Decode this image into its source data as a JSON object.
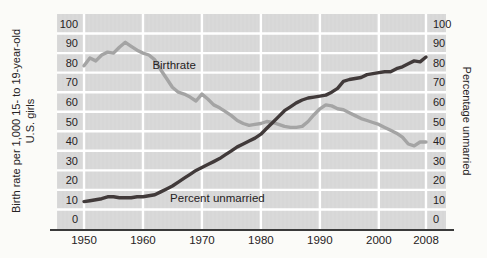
{
  "figure": {
    "left_axis_title_line1": "Birth rate per 1,000 15- to 19-year-old",
    "left_axis_title_line2": "U.S. girls",
    "right_axis_title": "Percentage unmarried"
  },
  "colors": {
    "panel_bg": "#d9d9d9",
    "gridline": "#ffffff",
    "axis_line": "#3a3a3a",
    "text": "#262223",
    "birthrate_line": "#a4a4a4",
    "unmarried_line": "#413a3a"
  },
  "chart_data": {
    "type": "line",
    "title": "",
    "xlabel": "",
    "ylabel_left": "Birth rate per 1,000 15- to 19-year-old U.S. girls",
    "ylabel_right": "Percentage unmarried",
    "xlim": [
      1950,
      2008
    ],
    "ylim": [
      0,
      100
    ],
    "grid": "white lines on gray banded panel",
    "legend_position": "inline annotations",
    "y_ticks_top_to_bottom": [
      100,
      90,
      80,
      70,
      60,
      50,
      40,
      30,
      20,
      10,
      0
    ],
    "x_ticks": [
      {
        "year": 1950,
        "label": "1950"
      },
      {
        "year": 1960,
        "label": "1960"
      },
      {
        "year": 1970,
        "label": "1970"
      },
      {
        "year": 1980,
        "label": "1980"
      },
      {
        "year": 1990,
        "label": "1990"
      },
      {
        "year": 2000,
        "label": "2000"
      },
      {
        "year": 2008,
        "label": "2008"
      }
    ],
    "x_gridline_years": [
      1950,
      1960,
      1970,
      1980,
      1990,
      2000,
      2008
    ],
    "x": [
      1950,
      1951,
      1952,
      1953,
      1954,
      1955,
      1956,
      1957,
      1958,
      1959,
      1960,
      1961,
      1962,
      1963,
      1964,
      1965,
      1966,
      1967,
      1968,
      1969,
      1970,
      1971,
      1972,
      1973,
      1974,
      1975,
      1976,
      1977,
      1978,
      1979,
      1980,
      1981,
      1982,
      1983,
      1984,
      1985,
      1986,
      1987,
      1988,
      1989,
      1990,
      1991,
      1992,
      1993,
      1994,
      1995,
      1996,
      1997,
      1998,
      1999,
      2000,
      2001,
      2002,
      2003,
      2004,
      2005,
      2006,
      2007,
      2008
    ],
    "series": [
      {
        "name": "Birthrate",
        "color_key": "birthrate_line",
        "values": [
          78.5,
          82.5,
          81,
          84,
          85.5,
          85,
          88,
          90.5,
          88.5,
          86.5,
          85,
          84,
          81.5,
          76.5,
          72,
          67.5,
          65,
          64,
          62.5,
          60.5,
          64,
          61.5,
          58.5,
          57,
          55,
          53,
          50.5,
          49,
          48,
          48.5,
          49,
          50,
          49.5,
          48.5,
          47.5,
          47,
          47,
          47.5,
          50,
          53.5,
          56.5,
          58.5,
          58,
          56.5,
          56,
          54.5,
          53,
          51.5,
          50.5,
          49.5,
          48.5,
          47,
          45.5,
          44,
          42,
          38.5,
          37.5,
          39.5,
          39.5
        ]
      },
      {
        "name": "Percent unmarried",
        "color_key": "unmarried_line",
        "values": [
          9,
          9.5,
          10,
          10.5,
          11.5,
          11.5,
          11,
          11,
          11,
          11.5,
          11.5,
          12,
          12.5,
          14,
          15.5,
          17,
          19,
          21,
          23,
          25,
          26.5,
          28,
          29.5,
          31,
          33,
          35,
          37,
          38.5,
          40,
          41.5,
          43.5,
          46.5,
          49.5,
          52.5,
          55.5,
          57.5,
          59.5,
          61,
          62,
          62.5,
          63,
          63.5,
          65,
          67,
          70.5,
          71.5,
          72,
          72.5,
          74,
          74.5,
          75,
          75.5,
          75.5,
          77,
          78,
          79.5,
          81,
          80.5,
          83
        ]
      }
    ],
    "annotations": [
      {
        "text": "Birthrate",
        "year": 1961.6,
        "value": 79,
        "anchor": "start"
      },
      {
        "text": "Percent unmarried",
        "year": 1964.6,
        "value": 11,
        "anchor": "start"
      }
    ]
  }
}
